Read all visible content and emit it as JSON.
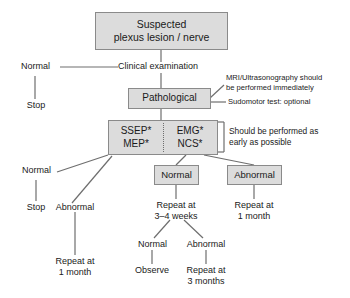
{
  "diagram": {
    "title_box": {
      "line1": "Suspected",
      "line2": "plexus lesion / nerve"
    },
    "clinical_exam_label": "Clinical examination",
    "normal_top_label": "Normal",
    "stop_top_label": "Stop",
    "pathological_box": "Pathological",
    "annotations": {
      "mri_line1": "MRI/Ultrasonography should",
      "mri_line2": "be performed immediately",
      "sudomotor": "Sudomotor test: optional",
      "early_line1": "Should be performed as",
      "early_line2": "early as possible"
    },
    "test_box": {
      "left_line1": "SSEP*",
      "left_line2": "MEP*",
      "right_line1": "EMG*",
      "right_line2": "NCS*"
    },
    "left_branch": {
      "normal_label": "Normal",
      "stop_label": "Stop",
      "abnormal_label": "Abnormal",
      "repeat_line1": "Repeat at",
      "repeat_line2": "1 month"
    },
    "normal_box": "Normal",
    "abnormal_box": "Abnormal",
    "normal_branch": {
      "repeat_line1": "Repeat at",
      "repeat_line2": "3–4 weeks",
      "sub_normal_label": "Normal",
      "sub_abnormal_label": "Abnormal",
      "observe_label": "Observe",
      "repeat3_line1": "Repeat at",
      "repeat3_line2": "3 months"
    },
    "abnormal_branch": {
      "repeat_line1": "Repeat at",
      "repeat_line2": "1 month"
    },
    "colors": {
      "box_fill": "#dcdcdc",
      "box_border": "#8a8a8a",
      "line": "#6e6e6e",
      "text": "#1a1a1a",
      "background": "#ffffff"
    }
  }
}
